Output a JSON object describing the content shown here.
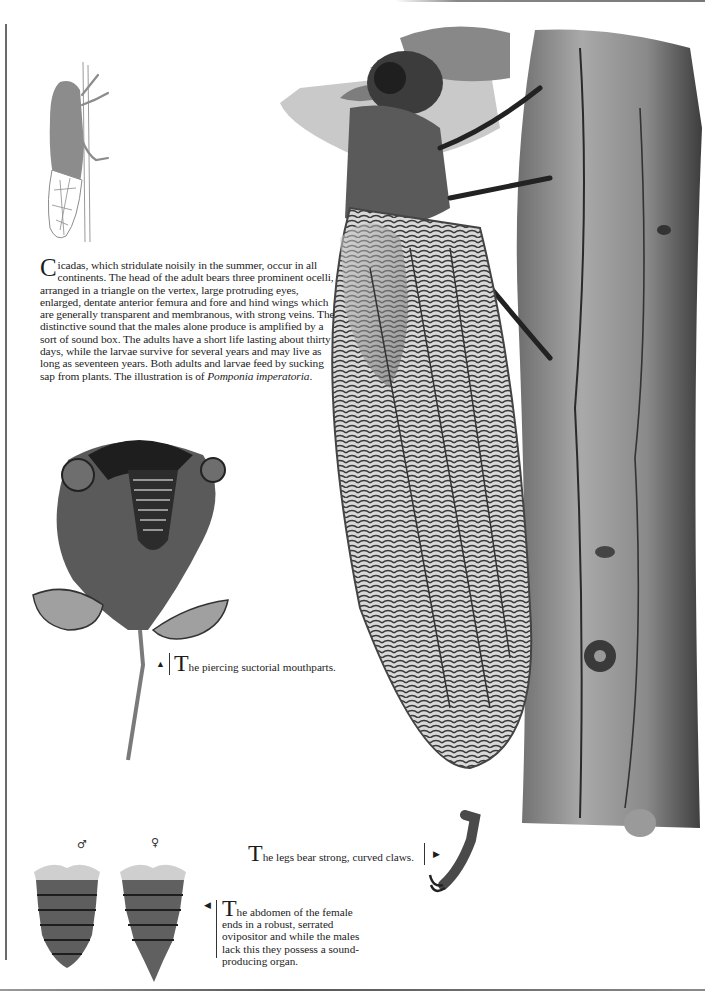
{
  "page": {
    "background": "#ffffff",
    "ink_color": "#1c1c1c"
  },
  "main_text": {
    "drop_cap": "C",
    "body_before_italic": "icadas, which stridulate noisily in the summer, occur in all continents. The head of the adult bears three prominent ocelli, arranged in a triangle on the vertex, large protruding eyes, enlarged, dentate anterior femura and fore and hind wings which are generally transparent and membranous, with strong veins. The distinctive sound that the males alone produce is amplified by a sort of sound box. The adults have a short life lasting about thirty days, while the larvae survive for several years and may live as long as seventeen years. Both adults and larvae feed by sucking sap from plants. The illustration is of ",
    "species_italic": "Pomponia imperatoria",
    "body_after_italic": "."
  },
  "captions": {
    "mouthparts": {
      "arrow": "▲",
      "drop_cap": "T",
      "text": "he piercing suctorial mouthparts."
    },
    "legs": {
      "arrow": "▶",
      "drop_cap": "T",
      "text": "he legs bear strong, curved claws."
    },
    "abdomen": {
      "arrow": "◀",
      "drop_cap": "T",
      "text": "he abdomen of the female ends in a robust, serrated ovipositor and while the males lack this they possess a sound-producing organ."
    }
  },
  "abdomen_labels": {
    "male_symbol": "♂",
    "female_symbol": "♀"
  },
  "illustrations": [
    "cicada-silhouette-on-stem",
    "cicada-main-illustration-on-bark",
    "head-mouthparts-detail",
    "leg-claw-detail",
    "abdomen-male",
    "abdomen-female"
  ]
}
